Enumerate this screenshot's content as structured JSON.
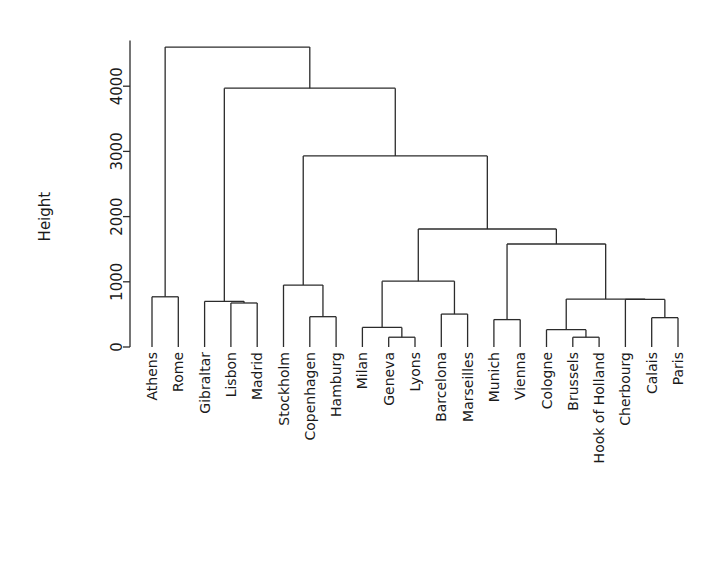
{
  "chart_data": {
    "type": "dendrogram",
    "title": "",
    "xlabel": "",
    "ylabel": "Height",
    "ylim": [
      0,
      4700
    ],
    "yticks": [
      0,
      1000,
      2000,
      3000,
      4000
    ],
    "ytick_labels": [
      "0",
      "1000",
      "2000",
      "3000",
      "4000"
    ],
    "grid": false,
    "legend": "none",
    "leaf_order": [
      "Athens",
      "Rome",
      "Gibraltar",
      "Lisbon",
      "Madrid",
      "Stockholm",
      "Copenhagen",
      "Hamburg",
      "Milan",
      "Geneva",
      "Lyons",
      "Barcelona",
      "Marseilles",
      "Munich",
      "Vienna",
      "Cologne",
      "Brussels",
      "Hook of Holland",
      "Cherbourg",
      "Calais",
      "Paris"
    ],
    "merges": [
      {
        "id": "m1",
        "left": "Athens",
        "right": "Rome",
        "height": 770
      },
      {
        "id": "m2",
        "left": "Lisbon",
        "right": "Madrid",
        "height": 675
      },
      {
        "id": "m3",
        "left": "Gibraltar",
        "right": "m2",
        "height": 700
      },
      {
        "id": "m4",
        "left": "Copenhagen",
        "right": "Hamburg",
        "height": 465
      },
      {
        "id": "m5",
        "left": "Stockholm",
        "right": "m4",
        "height": 950
      },
      {
        "id": "m6",
        "left": "Geneva",
        "right": "Lyons",
        "height": 150
      },
      {
        "id": "m7",
        "left": "Milan",
        "right": "m6",
        "height": 300
      },
      {
        "id": "m8",
        "left": "Barcelona",
        "right": "Marseilles",
        "height": 505
      },
      {
        "id": "m9",
        "left": "m7",
        "right": "m8",
        "height": 1010
      },
      {
        "id": "m10",
        "left": "Munich",
        "right": "Vienna",
        "height": 420
      },
      {
        "id": "m11",
        "left": "Calais",
        "right": "Paris",
        "height": 450
      },
      {
        "id": "m12",
        "left": "Cherbourg",
        "right": "m11",
        "height": 730
      },
      {
        "id": "m13",
        "left": "Brussels",
        "right": "Hook of Holland",
        "height": 150
      },
      {
        "id": "m14",
        "left": "Cologne",
        "right": "m13",
        "height": 265
      },
      {
        "id": "m15",
        "left": "m14",
        "right": "m12",
        "height": 735
      },
      {
        "id": "m16",
        "left": "m10",
        "right": "m15",
        "height": 1580
      },
      {
        "id": "m17",
        "left": "m9",
        "right": "m16",
        "height": 1810
      },
      {
        "id": "m18",
        "left": "m5",
        "right": "m17",
        "height": 2930
      },
      {
        "id": "m19",
        "left": "m3",
        "right": "m18",
        "height": 3970
      },
      {
        "id": "m20",
        "left": "m1",
        "right": "m19",
        "height": 4600
      }
    ]
  },
  "style": {
    "line_color": "#2b2b2b",
    "text_color": "#1a1a1a",
    "background": "#ffffff"
  }
}
